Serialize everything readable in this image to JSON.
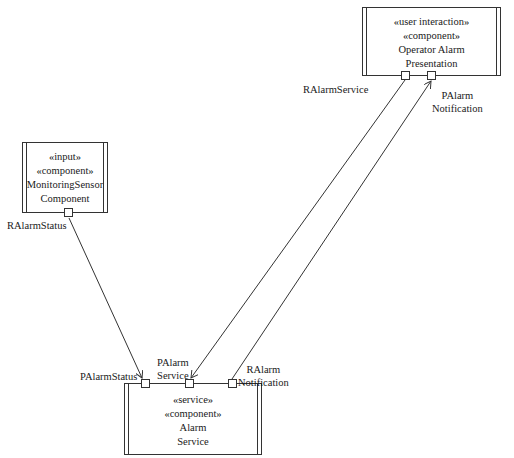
{
  "diagram": {
    "type": "UML component diagram",
    "components": [
      {
        "id": "operator_alarm_presentation",
        "stereotypes": [
          "«user interaction»",
          "«component»"
        ],
        "name_lines": [
          "Operator Alarm",
          "Presentation"
        ]
      },
      {
        "id": "monitoring_sensor_component",
        "stereotypes": [
          "«input»",
          "«component»"
        ],
        "name_lines": [
          "MonitoringSensor",
          "Component"
        ]
      },
      {
        "id": "alarm_service",
        "stereotypes": [
          "«service»",
          "«component»"
        ],
        "name_lines": [
          "Alarm",
          "Service"
        ]
      }
    ],
    "ports": {
      "operator_ralarmservice": "RAlarmService",
      "operator_palarmnotification": [
        "PAlarm",
        "Notification"
      ],
      "sensor_ralarmstatus": "RAlarmStatus",
      "alarm_palarmstatus": "PAlarmStatus",
      "alarm_palarmservice": [
        "PAlarm",
        "Service"
      ],
      "alarm_ralarmnotification": [
        "RAlarm",
        "Notification"
      ]
    },
    "connections": [
      {
        "from": "RAlarmStatus (MonitoringSensor Component)",
        "to": "PAlarmStatus (Alarm Service)"
      },
      {
        "from": "RAlarmService (Operator Alarm Presentation)",
        "to": "PAlarm Service (Alarm Service)"
      },
      {
        "from": "RAlarm Notification (Alarm Service)",
        "to": "PAlarm Notification (Operator Alarm Presentation)"
      }
    ],
    "colors": {
      "line": "#333333",
      "background": "#ffffff",
      "text": "#1a1a1a"
    }
  }
}
